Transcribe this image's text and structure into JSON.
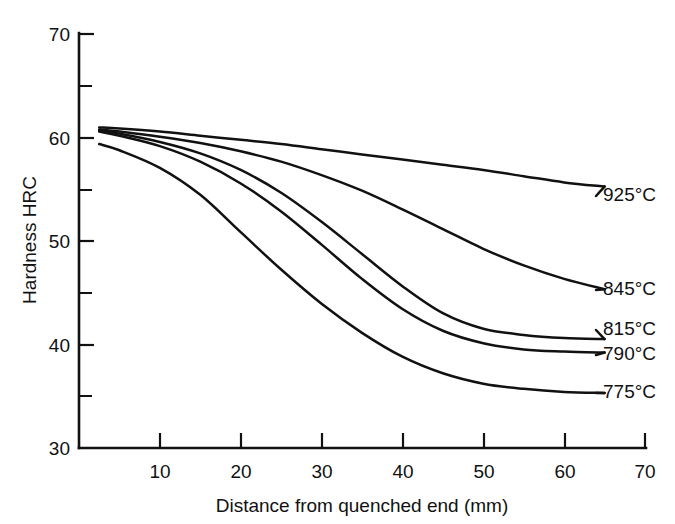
{
  "chart_data": {
    "type": "line",
    "title": "",
    "xlabel": "Distance from quenched end (mm)",
    "ylabel": "Hardness HRC",
    "xlim": [
      0,
      70
    ],
    "ylim": [
      30,
      70
    ],
    "grid": false,
    "legend_position": "right-inline-labels",
    "x_ticks_major": [
      10,
      20,
      30,
      40,
      50,
      60,
      70
    ],
    "x_ticks_major_labels": [
      "10",
      "20",
      "30",
      "40",
      "50",
      "60",
      "70"
    ],
    "y_ticks_major": [
      30,
      40,
      50,
      60,
      70
    ],
    "y_ticks_major_labels": [
      "30",
      "40",
      "50",
      "60",
      "70"
    ],
    "y_ticks_minor": [
      35,
      45,
      55,
      65
    ],
    "series": [
      {
        "name": "925°C",
        "label": "925°C",
        "color": "#111111",
        "x": [
          2.5,
          5,
          10,
          15,
          20,
          25,
          30,
          35,
          40,
          45,
          50,
          55,
          60,
          65
        ],
        "values": [
          60.9,
          60.8,
          60.5,
          60.1,
          59.7,
          59.3,
          58.8,
          58.3,
          57.8,
          57.3,
          56.8,
          56.2,
          55.6,
          55.2
        ]
      },
      {
        "name": "845°C",
        "label": "845°C",
        "color": "#111111",
        "x": [
          2.5,
          5,
          10,
          15,
          20,
          25,
          30,
          35,
          40,
          45,
          50,
          55,
          60,
          65
        ],
        "values": [
          60.7,
          60.5,
          60.0,
          59.4,
          58.6,
          57.6,
          56.3,
          54.8,
          53.0,
          51.1,
          49.2,
          47.6,
          46.3,
          45.3
        ]
      },
      {
        "name": "815°C",
        "label": "815°C",
        "color": "#111111",
        "x": [
          2.5,
          5,
          10,
          15,
          20,
          25,
          30,
          35,
          40,
          45,
          50,
          55,
          60,
          65
        ],
        "values": [
          60.6,
          60.3,
          59.5,
          58.4,
          56.8,
          54.6,
          51.8,
          48.7,
          45.6,
          43.0,
          41.5,
          40.9,
          40.6,
          40.5
        ]
      },
      {
        "name": "790°C",
        "label": "790°C",
        "color": "#111111",
        "x": [
          2.5,
          5,
          10,
          15,
          20,
          25,
          30,
          35,
          40,
          45,
          50,
          55,
          60,
          65
        ],
        "values": [
          60.5,
          60.1,
          59.1,
          57.6,
          55.5,
          52.8,
          49.6,
          46.3,
          43.4,
          41.3,
          40.1,
          39.5,
          39.3,
          39.2
        ]
      },
      {
        "name": "775°C",
        "label": "775°C",
        "color": "#111111",
        "x": [
          2.5,
          5,
          10,
          15,
          20,
          25,
          30,
          35,
          40,
          45,
          50,
          55,
          60,
          65
        ],
        "values": [
          59.3,
          58.7,
          57.0,
          54.4,
          50.8,
          47.2,
          43.9,
          41.1,
          38.8,
          37.2,
          36.2,
          35.7,
          35.4,
          35.3
        ]
      }
    ]
  },
  "axes": {
    "y_title": "Hardness HRC",
    "x_title": "Distance from quenched end (mm)"
  },
  "labels": {
    "y_70": "70",
    "y_60": "60",
    "y_50": "50",
    "y_40": "40",
    "y_30": "30",
    "x_10": "10",
    "x_20": "20",
    "x_30": "30",
    "x_40": "40",
    "x_50": "50",
    "x_60": "60",
    "x_70": "70",
    "s_925": "925°C",
    "s_845": "845°C",
    "s_815": "815°C",
    "s_790": "790°C",
    "s_775": "775°C"
  },
  "style": {
    "line_color": "#111111",
    "background": "#ffffff"
  }
}
